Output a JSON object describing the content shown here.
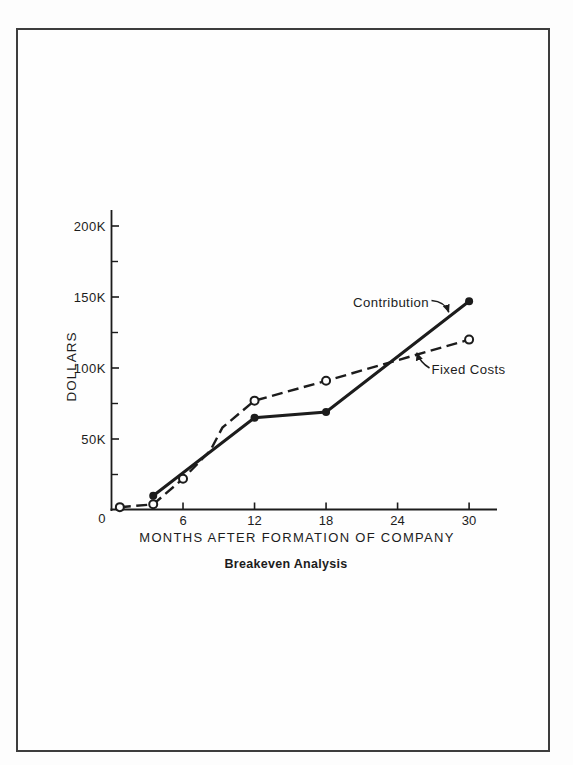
{
  "page": {
    "ink_color": "#1c1c1c",
    "paper_color": "#fdfdfd",
    "frame_color": "#3d3d3d"
  },
  "chart_data": {
    "type": "line",
    "title": "Breakeven Analysis",
    "xlabel": "MONTHS AFTER FORMATION OF COMPANY",
    "ylabel": "DOLLARS",
    "units": "thousands of dollars",
    "xlim": [
      0,
      32.3
    ],
    "ylim": [
      0,
      210
    ],
    "grid": false,
    "legend_position": "inline-annotations",
    "x_ticks": [
      6,
      12,
      18,
      24,
      30
    ],
    "y_major_ticks": [
      {
        "value": 0,
        "label": "0"
      },
      {
        "value": 50,
        "label": "50K"
      },
      {
        "value": 100,
        "label": "100K"
      },
      {
        "value": 150,
        "label": "150K"
      },
      {
        "value": 200,
        "label": "200K"
      }
    ],
    "y_minor_ticks": [
      25,
      75,
      125,
      175
    ],
    "series": [
      {
        "name": "Contribution",
        "style": "solid",
        "marker": "filled-circle",
        "points": [
          [
            3.5,
            10
          ],
          [
            12,
            65
          ],
          [
            18,
            69
          ],
          [
            30,
            147
          ]
        ]
      },
      {
        "name": "Fixed Costs",
        "style": "dashed",
        "marker": "open-circle",
        "points": [
          [
            0.7,
            2
          ],
          [
            3.5,
            4
          ],
          [
            6,
            22
          ],
          [
            12,
            77
          ],
          [
            18,
            91
          ],
          [
            30,
            120
          ]
        ],
        "line_points": [
          [
            0.7,
            2
          ],
          [
            3.5,
            4
          ],
          [
            6,
            22
          ],
          [
            8.3,
            42
          ],
          [
            9.3,
            58
          ],
          [
            12,
            77
          ],
          [
            18,
            91
          ],
          [
            30,
            120
          ]
        ]
      }
    ],
    "annotations": [
      {
        "text": "Contribution",
        "series": "Contribution"
      },
      {
        "text": "Fixed Costs",
        "series": "Fixed Costs"
      }
    ],
    "breakeven_point": {
      "x": 23,
      "y": 105
    }
  }
}
